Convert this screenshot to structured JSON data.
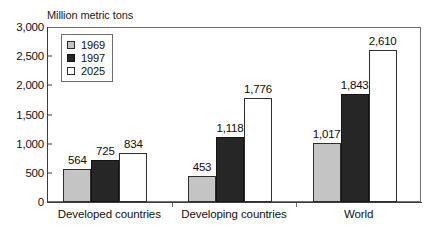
{
  "chart_data": {
    "type": "bar",
    "title": "",
    "ylabel": "Million metric tons",
    "xlabel": "",
    "ylim": [
      0,
      3000
    ],
    "yticks": [
      "0",
      "500",
      "1,000",
      "1,500",
      "2,000",
      "2,500",
      "3,000"
    ],
    "ytick_values": [
      0,
      500,
      1000,
      1500,
      2000,
      2500,
      3000
    ],
    "grid": false,
    "legend_position": "upper-left-inside",
    "categories": [
      "Developed countries",
      "Developing countries",
      "World"
    ],
    "series": [
      {
        "name": "1969",
        "color": "#c4c4c4",
        "values": [
          564,
          453,
          1017
        ],
        "labels": [
          "564",
          "453",
          "1,017"
        ]
      },
      {
        "name": "1997",
        "color": "#262626",
        "values": [
          725,
          1118,
          1843
        ],
        "labels": [
          "725",
          "1,118",
          "1,843"
        ]
      },
      {
        "name": "2025",
        "color": "#ffffff",
        "values": [
          834,
          1776,
          2610
        ],
        "labels": [
          "834",
          "1,776",
          "2,610"
        ]
      }
    ]
  },
  "colors": {
    "series_1969": "#c4c4c4",
    "series_1997": "#262626",
    "series_2025": "#ffffff",
    "axis": "#3d3d3d",
    "frame": "#6e6e6e",
    "text": "#111111",
    "background": "#ffffff"
  }
}
